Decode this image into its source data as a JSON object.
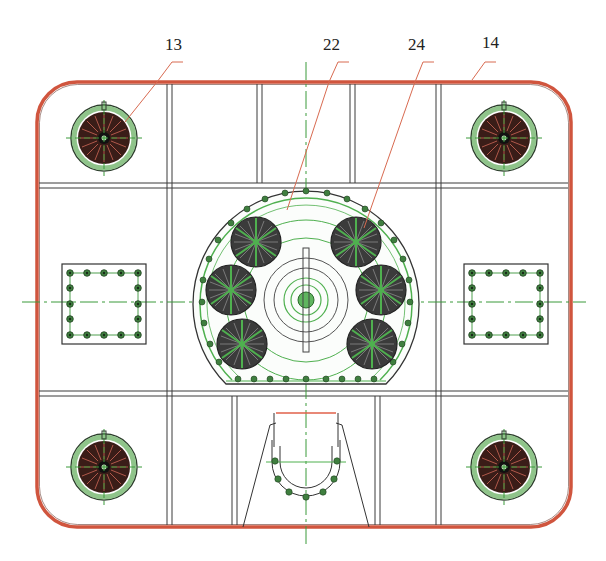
{
  "diagram": {
    "type": "engineering-drawing-plan-view",
    "colors": {
      "outline": "#d0553e",
      "structure": "#3a3a3a",
      "centerline": "#3a9a3a",
      "bolt": "#3f7f3f",
      "leader": "#d86a50",
      "motor_dark": "#2a2a2a",
      "coil": "#7a2a20",
      "ring_green": "#8fc48a"
    },
    "callouts": [
      {
        "id": "13",
        "label": "13",
        "label_x": 165,
        "label_y": 35,
        "target": "corner-motor-top-left"
      },
      {
        "id": "22",
        "label": "22",
        "label_x": 323,
        "label_y": 35,
        "target": "central-hub-housing"
      },
      {
        "id": "24",
        "label": "24",
        "label_x": 408,
        "label_y": 35,
        "target": "thruster-motor-cluster"
      },
      {
        "id": "14",
        "label": "14",
        "label_x": 482,
        "label_y": 33,
        "target": "outer-frame"
      }
    ],
    "corner_units": [
      {
        "name": "corner-unit-top-left",
        "cx": 104,
        "cy": 138
      },
      {
        "name": "corner-unit-top-right",
        "cx": 504,
        "cy": 138
      },
      {
        "name": "corner-unit-bottom-left",
        "cx": 104,
        "cy": 467
      },
      {
        "name": "corner-unit-bottom-right",
        "cx": 504,
        "cy": 467
      }
    ],
    "cluster_motors": [
      {
        "name": "motor-upper-left",
        "cx": 256,
        "cy": 242
      },
      {
        "name": "motor-mid-left",
        "cx": 231,
        "cy": 290
      },
      {
        "name": "motor-lower-left",
        "cx": 242,
        "cy": 344
      },
      {
        "name": "motor-upper-right",
        "cx": 356,
        "cy": 242
      },
      {
        "name": "motor-mid-right",
        "cx": 381,
        "cy": 290
      },
      {
        "name": "motor-lower-right",
        "cx": 372,
        "cy": 344
      }
    ],
    "bolt_plates": [
      {
        "name": "bolt-plate-left",
        "x": 62,
        "y": 264,
        "w": 84,
        "h": 80
      },
      {
        "name": "bolt-plate-right",
        "x": 464,
        "y": 264,
        "w": 84,
        "h": 80
      }
    ]
  }
}
